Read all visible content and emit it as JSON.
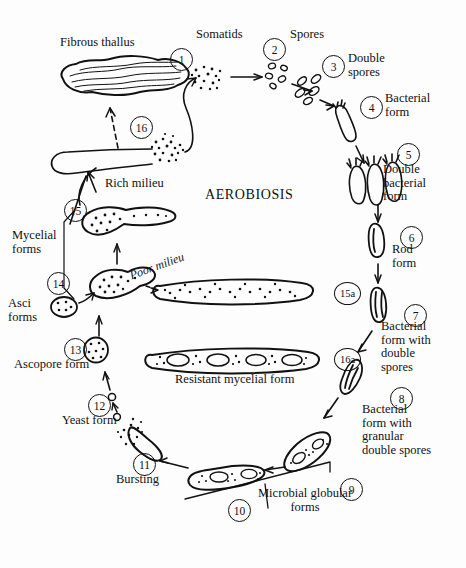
{
  "diagram": {
    "title": "AEROBIOSIS",
    "background": "#fdfdfd",
    "ink": "#111111",
    "type": "life-cycle",
    "stage_count": 16
  },
  "stages": [
    {
      "n": "1",
      "label": "Somatids",
      "x": 170,
      "y": 48,
      "lx": 196,
      "ly": 28
    },
    {
      "n": "2",
      "label": "Spores",
      "x": 263,
      "y": 38,
      "lx": 290,
      "ly": 28
    },
    {
      "n": "3",
      "label": "Double\nspores",
      "x": 322,
      "y": 55,
      "lx": 348,
      "ly": 52
    },
    {
      "n": "4",
      "label": "Bacterial\nform",
      "x": 360,
      "y": 96,
      "lx": 385,
      "ly": 92
    },
    {
      "n": "5",
      "label": "Double\nbacterial\nform",
      "x": 397,
      "y": 143,
      "lx": 383,
      "ly": 163
    },
    {
      "n": "6",
      "label": "Rod\nform",
      "x": 400,
      "y": 226,
      "lx": 392,
      "ly": 243
    },
    {
      "n": "7",
      "label": "Bacterial\nform with\ndouble\nspores",
      "x": 404,
      "y": 304,
      "lx": 381,
      "ly": 320
    },
    {
      "n": "8",
      "label": "Bacterial\nform with\ngranular\ndouble spores",
      "x": 390,
      "y": 387,
      "lx": 362,
      "ly": 403
    },
    {
      "n": "9",
      "label": "",
      "x": 340,
      "y": 478,
      "lx": 0,
      "ly": 0
    },
    {
      "n": "10",
      "label": "Microbial globular\nforms",
      "x": 228,
      "y": 499,
      "lx": 258,
      "ly": 487
    },
    {
      "n": "11",
      "label": "Bursting",
      "x": 133,
      "y": 453,
      "lx": 116,
      "ly": 473
    },
    {
      "n": "12",
      "label": "Yeast form",
      "x": 88,
      "y": 394,
      "lx": 62,
      "ly": 414
    },
    {
      "n": "13",
      "label": "Ascopore form",
      "x": 64,
      "y": 338,
      "lx": 14,
      "ly": 358
    },
    {
      "n": "14",
      "label": "Asci\nforms",
      "x": 47,
      "y": 272,
      "lx": 8,
      "ly": 297
    },
    {
      "n": "15",
      "label": "Mycelial\nforms",
      "x": 64,
      "y": 199,
      "lx": 12,
      "ly": 229
    },
    {
      "n": "16",
      "label": "",
      "x": 130,
      "y": 116,
      "lx": 0,
      "ly": 0
    },
    {
      "n": "15a",
      "label": "",
      "x": 334,
      "y": 282,
      "lx": 0,
      "ly": 0
    },
    {
      "n": "16a",
      "label": "Resistant mycelial form",
      "x": 334,
      "y": 348,
      "lx": 175,
      "ly": 373
    }
  ],
  "annotations": {
    "fibrous_thallus": "Fibrous thallus",
    "rich_milieu": "Rich milieu",
    "poor_milieu": "Poor\nmilieu",
    "aerobiosis": "AEROBIOSIS"
  }
}
